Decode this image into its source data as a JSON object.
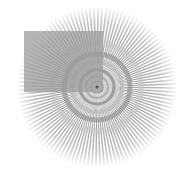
{
  "image": {
    "width": 187,
    "height": 173,
    "background": "#ffffff",
    "subject": "radial starburst test pattern with gray square overlay"
  },
  "star": {
    "cx": 97,
    "cy": 87,
    "outer_radius": 80,
    "spokes": 120,
    "spoke_color": "#8a8a8a",
    "rings": [
      {
        "r": 6,
        "color": "#6f6f6f",
        "width": 1.2
      },
      {
        "r": 11,
        "color": "#9a9a9a",
        "width": 2
      },
      {
        "r": 17,
        "color": "#7a7a7a",
        "width": 3
      },
      {
        "r": 25,
        "color": "#b5b5b5",
        "width": 4
      },
      {
        "r": 33,
        "color": "#8c8c8c",
        "width": 5
      },
      {
        "r": 44,
        "color": "#c8c8c8",
        "width": 6
      }
    ]
  },
  "overlay_square": {
    "x": 24,
    "y": 31,
    "width": 79,
    "height": 61,
    "color": "#9c9c9c",
    "opacity": 0.75
  }
}
